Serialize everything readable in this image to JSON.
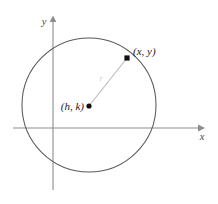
{
  "figure": {
    "background_color": "#ffffff",
    "width": 218,
    "height": 204
  },
  "axes": {
    "x_axis": {
      "label": "x",
      "color": "#8c8c8c",
      "y_position": 128,
      "x_start": 13,
      "x_end": 200,
      "label_x": 202,
      "label_y": 140,
      "arrow": "arrow-right"
    },
    "y_axis": {
      "label": "y",
      "color": "#8c8c8c",
      "x_position": 53,
      "y_start": 18,
      "y_end": 190,
      "label_x": 44,
      "label_y": 25,
      "arrow": "arrow-up"
    }
  },
  "circle": {
    "center_x": 89,
    "center_y": 105,
    "radius": 67,
    "stroke_color": "#5a5a5a",
    "fill": "none",
    "stroke_width": 1
  },
  "points": [
    {
      "id": "center-point",
      "label": "(h, k)",
      "x": 89,
      "y": 106,
      "marker": "dot",
      "marker_color": "#111111",
      "label_x": 84,
      "label_y": 110,
      "label_anchor": "end"
    },
    {
      "id": "circumference-point",
      "label": "(x, y)",
      "x": 127,
      "y": 58,
      "marker": "square",
      "marker_color": "#111111",
      "label_x": 133,
      "label_y": 55,
      "label_anchor": "start"
    }
  ],
  "radius_segment": {
    "label": "r",
    "from_x": 89,
    "from_y": 106,
    "to_x": 127,
    "to_y": 58,
    "color": "#bdbdbd",
    "label_x": 101,
    "label_y": 81
  }
}
